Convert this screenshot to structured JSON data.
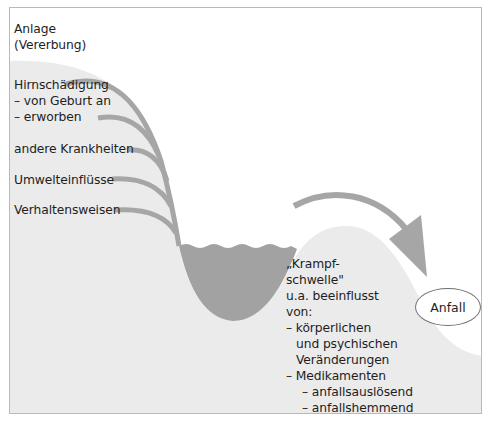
{
  "colors": {
    "terrain": "#ebebeb",
    "water": "#a2a2a2",
    "arrow": "#a6a6a6",
    "frame": "#b9b9b9",
    "text": "#1e1e1e"
  },
  "factors": [
    {
      "lines": [
        "Anlage",
        "(Vererbung)"
      ]
    },
    {
      "lines": [
        "Hirnschädigung",
        "– von Geburt an",
        "– erworben"
      ]
    },
    {
      "lines": [
        "andere Krankheiten"
      ]
    },
    {
      "lines": [
        "Umwelteinflüsse"
      ]
    },
    {
      "lines": [
        "Verhaltensweisen"
      ]
    }
  ],
  "threshold": {
    "lines": [
      "„Krampf-",
      "schwelle\"",
      "u.a. beeinflusst",
      "von:",
      "– körperlichen",
      "und psychischen",
      "Veränderungen",
      "– Medikamenten",
      "– anfallsauslösend",
      "– anfallshemmend"
    ]
  },
  "outcome": {
    "label": "Anfall"
  }
}
